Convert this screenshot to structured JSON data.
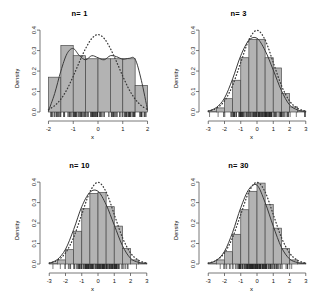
{
  "figure": {
    "layout": "2x2 grid of histograms",
    "ylabel": "Density",
    "xlabel": "x",
    "bar_fill": "#b3b3b3",
    "bar_stroke": "#4a4a4a",
    "density_curve_color": "#3a3a3a",
    "normal_curve_color": "#3a3a3a",
    "axis_color": "#555555"
  },
  "chart_data": [
    {
      "type": "bar",
      "title": "n= 1",
      "xlabel": "x",
      "ylabel": "Density",
      "xlim": [
        -2.1,
        2.1
      ],
      "ylim": [
        0,
        0.42
      ],
      "xticks": [
        -2,
        -1,
        0,
        1,
        2
      ],
      "xticklabels": [
        "-2",
        "-1",
        "0",
        "1",
        "2"
      ],
      "yticks": [
        0.0,
        0.1,
        0.2,
        0.3,
        0.4
      ],
      "yticklabels": [
        "0.0",
        "0.1",
        "0.2",
        "0.3",
        "0.4"
      ],
      "grid": false,
      "bin_edges": [
        -2.0,
        -1.5,
        -1.0,
        -0.5,
        0.0,
        0.5,
        1.0,
        1.5,
        2.0
      ],
      "values": [
        0.17,
        0.325,
        0.275,
        0.26,
        0.26,
        0.26,
        0.26,
        0.13
      ],
      "series": [
        {
          "name": "kernel density estimate",
          "style": "solid",
          "x": [
            -2.0,
            -1.75,
            -1.5,
            -1.25,
            -1.0,
            -0.75,
            -0.5,
            -0.25,
            0.0,
            0.25,
            0.5,
            0.75,
            1.0,
            1.25,
            1.5,
            1.75,
            2.0
          ],
          "y": [
            0.005,
            0.09,
            0.2,
            0.285,
            0.31,
            0.275,
            0.255,
            0.275,
            0.265,
            0.255,
            0.275,
            0.27,
            0.258,
            0.262,
            0.258,
            0.155,
            0.01
          ]
        },
        {
          "name": "normal reference density",
          "style": "dotted",
          "x": [
            -2.0,
            -1.75,
            -1.5,
            -1.25,
            -1.0,
            -0.75,
            -0.5,
            -0.25,
            0.0,
            0.25,
            0.5,
            0.75,
            1.0,
            1.25,
            1.5,
            1.75,
            2.0
          ],
          "y": [
            0.012,
            0.031,
            0.063,
            0.111,
            0.175,
            0.245,
            0.31,
            0.359,
            0.378,
            0.359,
            0.31,
            0.245,
            0.175,
            0.111,
            0.063,
            0.031,
            0.012
          ]
        }
      ],
      "rug": true
    },
    {
      "type": "bar",
      "title": "n= 3",
      "xlabel": "x",
      "ylabel": "Density",
      "xlim": [
        -3.2,
        3.2
      ],
      "ylim": [
        0,
        0.42
      ],
      "xticks": [
        -3,
        -2,
        -1,
        0,
        1,
        2,
        3
      ],
      "xticklabels": [
        "-3",
        "-2",
        "-1",
        "0",
        "1",
        "2",
        "3"
      ],
      "yticks": [
        0.0,
        0.1,
        0.2,
        0.3,
        0.4
      ],
      "yticklabels": [
        "0.0",
        "0.1",
        "0.2",
        "0.3",
        "0.4"
      ],
      "grid": false,
      "bin_edges": [
        -3.0,
        -2.5,
        -2.0,
        -1.5,
        -1.0,
        -0.5,
        0.0,
        0.5,
        1.0,
        1.5,
        2.0,
        2.5,
        3.0
      ],
      "values": [
        0.005,
        0.02,
        0.065,
        0.155,
        0.265,
        0.355,
        0.355,
        0.265,
        0.215,
        0.09,
        0.025,
        0.005
      ],
      "series": [
        {
          "name": "kernel density estimate",
          "style": "solid",
          "x": [
            -3.0,
            -2.5,
            -2.0,
            -1.5,
            -1.0,
            -0.5,
            0.0,
            0.5,
            1.0,
            1.5,
            2.0,
            2.5,
            3.0
          ],
          "y": [
            0.004,
            0.022,
            0.068,
            0.162,
            0.275,
            0.35,
            0.36,
            0.3,
            0.205,
            0.105,
            0.035,
            0.01,
            0.002
          ]
        },
        {
          "name": "normal reference density",
          "style": "dotted",
          "x": [
            -3.0,
            -2.5,
            -2.0,
            -1.5,
            -1.0,
            -0.5,
            0.0,
            0.5,
            1.0,
            1.5,
            2.0,
            2.5,
            3.0
          ],
          "y": [
            0.004,
            0.018,
            0.054,
            0.13,
            0.242,
            0.352,
            0.399,
            0.352,
            0.242,
            0.13,
            0.054,
            0.018,
            0.004
          ]
        }
      ],
      "rug": true
    },
    {
      "type": "bar",
      "title": "n= 10",
      "xlabel": "x",
      "ylabel": "Density",
      "xlim": [
        -3.2,
        3.2
      ],
      "ylim": [
        0,
        0.42
      ],
      "xticks": [
        -3,
        -2,
        -1,
        0,
        1,
        2,
        3
      ],
      "xticklabels": [
        "-3",
        "-2",
        "-1",
        "0",
        "1",
        "2",
        "3"
      ],
      "yticks": [
        0.0,
        0.1,
        0.2,
        0.3,
        0.4
      ],
      "yticklabels": [
        "0.0",
        "0.1",
        "0.2",
        "0.3",
        "0.4"
      ],
      "grid": false,
      "bin_edges": [
        -3.0,
        -2.5,
        -2.0,
        -1.5,
        -1.0,
        -0.5,
        0.0,
        0.5,
        1.0,
        1.5,
        2.0,
        2.5,
        3.0
      ],
      "values": [
        0.005,
        0.02,
        0.07,
        0.16,
        0.27,
        0.345,
        0.35,
        0.28,
        0.185,
        0.075,
        0.02,
        0.005
      ],
      "series": [
        {
          "name": "kernel density estimate",
          "style": "solid",
          "x": [
            -3.0,
            -2.5,
            -2.0,
            -1.5,
            -1.0,
            -0.5,
            0.0,
            0.5,
            1.0,
            1.5,
            2.0,
            2.5,
            3.0
          ],
          "y": [
            0.004,
            0.022,
            0.072,
            0.168,
            0.28,
            0.35,
            0.355,
            0.29,
            0.19,
            0.09,
            0.028,
            0.008,
            0.002
          ]
        },
        {
          "name": "normal reference density",
          "style": "dotted",
          "x": [
            -3.0,
            -2.5,
            -2.0,
            -1.5,
            -1.0,
            -0.5,
            0.0,
            0.5,
            1.0,
            1.5,
            2.0,
            2.5,
            3.0
          ],
          "y": [
            0.004,
            0.018,
            0.054,
            0.13,
            0.242,
            0.352,
            0.399,
            0.352,
            0.242,
            0.13,
            0.054,
            0.018,
            0.004
          ]
        }
      ],
      "rug": true
    },
    {
      "type": "bar",
      "title": "n= 30",
      "xlabel": "x",
      "ylabel": "Density",
      "xlim": [
        -3.2,
        3.2
      ],
      "ylim": [
        0,
        0.42
      ],
      "xticks": [
        -3,
        -2,
        -1,
        0,
        1,
        2,
        3
      ],
      "xticklabels": [
        "-3",
        "-2",
        "-1",
        "0",
        "1",
        "2",
        "3"
      ],
      "yticks": [
        0.0,
        0.1,
        0.2,
        0.3,
        0.4
      ],
      "yticklabels": [
        "0.0",
        "0.1",
        "0.2",
        "0.3",
        "0.4"
      ],
      "grid": false,
      "bin_edges": [
        -3.0,
        -2.5,
        -2.0,
        -1.5,
        -1.0,
        -0.5,
        0.0,
        0.5,
        1.0,
        1.5,
        2.0,
        2.5,
        3.0
      ],
      "values": [
        0.005,
        0.02,
        0.06,
        0.145,
        0.265,
        0.355,
        0.395,
        0.29,
        0.175,
        0.075,
        0.02,
        0.005
      ],
      "series": [
        {
          "name": "kernel density estimate",
          "style": "solid",
          "x": [
            -3.0,
            -2.5,
            -2.0,
            -1.5,
            -1.0,
            -0.5,
            0.0,
            0.5,
            1.0,
            1.5,
            2.0,
            2.5,
            3.0
          ],
          "y": [
            0.003,
            0.018,
            0.062,
            0.155,
            0.275,
            0.365,
            0.385,
            0.3,
            0.185,
            0.082,
            0.025,
            0.007,
            0.002
          ]
        },
        {
          "name": "normal reference density",
          "style": "dotted",
          "x": [
            -3.0,
            -2.5,
            -2.0,
            -1.5,
            -1.0,
            -0.5,
            0.0,
            0.5,
            1.0,
            1.5,
            2.0,
            2.5,
            3.0
          ],
          "y": [
            0.004,
            0.018,
            0.054,
            0.13,
            0.242,
            0.352,
            0.399,
            0.352,
            0.242,
            0.13,
            0.054,
            0.018,
            0.004
          ]
        }
      ],
      "rug": true
    }
  ]
}
